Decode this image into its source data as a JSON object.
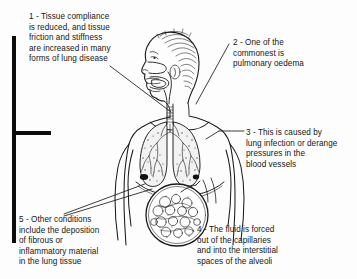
{
  "figure": {
    "background_color": "#fdfdfd",
    "ink_color": "#151515",
    "bracket_color": "#0d0d0d",
    "annotations": [
      {
        "number": "1",
        "text": "1 - Tissue compliance\nis reduced, and tissue\nfriction and stiffness\nare increased in many\nforms of lung disease"
      },
      {
        "number": "2",
        "text": "2 - One of the\ncommonest is\npulmonary oedema"
      },
      {
        "number": "3",
        "text": "3 - This is caused by\nlung infection or derange\npressures in the\nblood vessels"
      },
      {
        "number": "4",
        "text": "4 - The fluid is forced\nout of the capillaries\nand into the interstitial\nspaces of the alveoli"
      },
      {
        "number": "5",
        "text": "5 - Other conditions\ninclude the deposition\nof fibrous or\ninflammatory material\nin the lung tissue"
      }
    ],
    "illustration": {
      "subject": "human-torso-profile-with-lungs",
      "parts": [
        "head-in-profile",
        "hair",
        "nasal-cavity",
        "oral-cavity-tongue",
        "pharynx",
        "trachea",
        "left-lung",
        "right-lung",
        "bronchial-tree",
        "diaphragm",
        "rib-cage-outline",
        "shoulders-and-arms",
        "alveoli-magnification-circle"
      ]
    }
  }
}
